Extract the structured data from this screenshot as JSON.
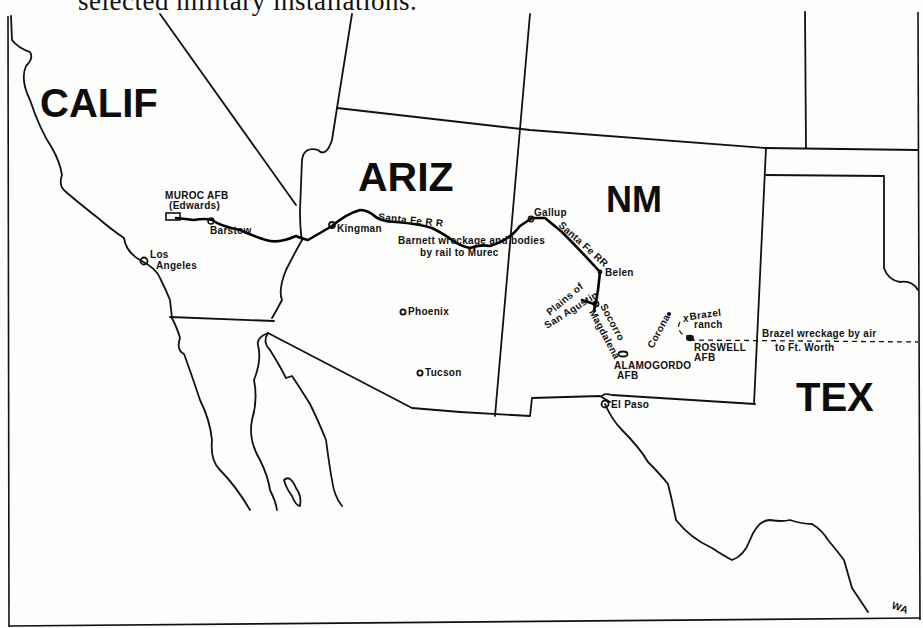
{
  "caption": "selected military installations.",
  "states": {
    "calif": "CALIF",
    "ariz": "ARIZ",
    "nm": "NM",
    "tex": "TEX"
  },
  "places": {
    "muroc": "MUROC AFB",
    "muroc_sub": "(Edwards)",
    "barstow": "Barstow",
    "los_angeles_1": "Los",
    "los_angeles_2": "Angeles",
    "kingman": "Kingman",
    "phoenix": "Phoenix",
    "tucson": "Tucson",
    "gallup": "Gallup",
    "belen": "Belen",
    "plains_1": "Plains of",
    "plains_2": "San Agustin",
    "socorro": "Socorro",
    "magdalena": "Magdalena",
    "corona": "Corona",
    "brazel_1": "Brazel",
    "brazel_2": "ranch",
    "roswell_1": "ROSWELL",
    "roswell_2": "AFB",
    "alamogordo_1": "ALAMOGORDO",
    "alamogordo_2": "AFB",
    "el_paso": "El Paso"
  },
  "annotations": {
    "santa_fe_rr_az": "Santa Fe R R",
    "santa_fe_rr_nm": "Santa Fe RR",
    "barnett_1": "Barnett wreckage and bodies",
    "barnett_2": "by rail to Murec",
    "brazel_air_1": "Brazel wreckage by air",
    "brazel_air_2": "to Ft. Worth"
  },
  "signature": "WA",
  "colors": {
    "ink": "#111111",
    "paper": "#fdfdfb"
  }
}
